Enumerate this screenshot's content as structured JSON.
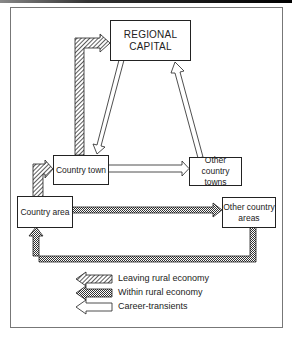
{
  "diagram": {
    "nodes": {
      "regional_capital": {
        "line1": "REGIONAL",
        "line2": "CAPITAL"
      },
      "country_town": {
        "label": "Country town"
      },
      "other_country_towns": {
        "line1": "Other country",
        "line2": "towns"
      },
      "country_area": {
        "label": "Country area"
      },
      "other_country_areas": {
        "line1": "Other country",
        "line2": "areas"
      }
    },
    "edges": [
      {
        "from": "Country town",
        "to": "REGIONAL CAPITAL",
        "type": "Leaving rural economy"
      },
      {
        "from": "Country area",
        "to": "Country town",
        "type": "Leaving rural economy"
      },
      {
        "from": "REGIONAL CAPITAL",
        "to": "Country town",
        "type": "Career-transients"
      },
      {
        "from": "Other country towns",
        "to": "REGIONAL CAPITAL",
        "type": "Career-transients"
      },
      {
        "from": "Country town",
        "to": "Other country towns",
        "type": "Career-transients"
      },
      {
        "from": "Country area",
        "to": "Other country areas",
        "type": "Within rural economy"
      },
      {
        "from": "Other country areas",
        "to": "Country area",
        "type": "Within rural economy"
      }
    ],
    "legend": [
      {
        "label": "Leaving rural economy",
        "pattern": "hatched"
      },
      {
        "label": "Within rural economy",
        "pattern": "checkered"
      },
      {
        "label": "Career-transients",
        "pattern": "white"
      }
    ]
  }
}
